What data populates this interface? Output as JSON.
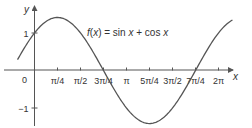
{
  "chart_data": {
    "type": "line",
    "title": "",
    "function_label": "f(x) = sin x + cos x",
    "function_label_parts": {
      "f": "f",
      "paren_open": "(",
      "x1": "x",
      "paren_close": ")",
      "eq": " = sin ",
      "x2": "x",
      "plus": " + cos ",
      "x3": "x"
    },
    "xlabel": "x",
    "ylabel": "y",
    "origin_label": "0",
    "x_ticks": [
      {
        "value": 0.7853981634,
        "label": "π/4"
      },
      {
        "value": 1.5707963268,
        "label": "π/2"
      },
      {
        "value": 2.3561944902,
        "label": "3π/4"
      },
      {
        "value": 3.1415926536,
        "label": "π"
      },
      {
        "value": 3.926990817,
        "label": "5π/4"
      },
      {
        "value": 4.7123889804,
        "label": "3π/2"
      },
      {
        "value": 5.4977871438,
        "label": "7π/4"
      },
      {
        "value": 6.2831853072,
        "label": "2π"
      }
    ],
    "y_ticks": [
      {
        "value": 1,
        "label": "1"
      },
      {
        "value": -1,
        "label": "−1"
      }
    ],
    "xlim": [
      -0.58,
      6.76
    ],
    "ylim": [
      -1.414,
      1.414
    ],
    "series": [
      {
        "name": "f(x) = sin x + cos x",
        "x": [
          -0.58,
          0,
          0.785,
          1.571,
          2.356,
          3.142,
          3.927,
          4.712,
          5.498,
          6.283,
          6.76
        ],
        "y": [
          0.27,
          1,
          1.414,
          1,
          0,
          -1,
          -1.414,
          -1,
          0,
          1,
          1.34
        ]
      }
    ],
    "key_points": {
      "max": {
        "x": "π/4",
        "y": 1.414
      },
      "min": {
        "x": "5π/4",
        "y": -1.414
      },
      "zeros": [
        "3π/4",
        "7π/4"
      ],
      "y_intercept": 1
    },
    "grid": false,
    "legend": "none",
    "colors": {
      "curve": "#555555",
      "axis": "#555555",
      "text": "#333333"
    }
  }
}
